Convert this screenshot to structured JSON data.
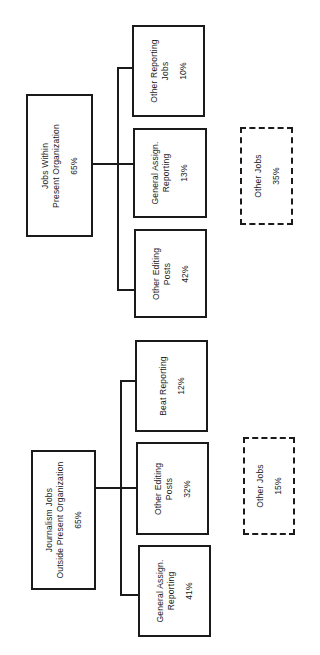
{
  "diagram": {
    "orientation": "rotated-90-ccw",
    "groups": [
      {
        "id": "within",
        "root": {
          "lines": [
            "Jobs Within",
            "Present Organization"
          ],
          "percent": "65%"
        },
        "children": [
          {
            "lines": [
              "Other Reporting",
              "Jobs"
            ],
            "percent": "10%"
          },
          {
            "lines": [
              "General Assign.",
              "Reporting"
            ],
            "percent": "13%"
          },
          {
            "lines": [
              "Other Editing",
              "Posts"
            ],
            "percent": "42%"
          }
        ],
        "other": {
          "lines": [
            "Other Jobs"
          ],
          "percent": "35%"
        }
      },
      {
        "id": "outside",
        "root": {
          "lines": [
            "Journalism Jobs",
            "Outside Present Organization"
          ],
          "percent": "65%"
        },
        "children": [
          {
            "lines": [
              "Beat Reporting"
            ],
            "percent": "12%"
          },
          {
            "lines": [
              "Other Editing",
              "Posts"
            ],
            "percent": "32%"
          },
          {
            "lines": [
              "General Assign.",
              "Reporting"
            ],
            "percent": "41%"
          }
        ],
        "other": {
          "lines": [
            "Other Jobs"
          ],
          "percent": "15%"
        }
      }
    ]
  }
}
